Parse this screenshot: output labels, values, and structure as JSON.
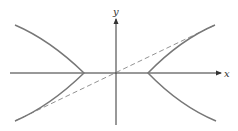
{
  "diagram": {
    "type": "hyperbola",
    "axes": {
      "x_label": "x",
      "y_label": "y"
    },
    "center": {
      "px": 116,
      "py": 73
    },
    "semi_axis_a_px": 32,
    "semi_axis_b_px": 16,
    "asymptote_style": "dashed",
    "colors": {
      "curve": "#777777",
      "axes": "#333333",
      "asymptote": "#777777",
      "background": "#ffffff"
    }
  }
}
